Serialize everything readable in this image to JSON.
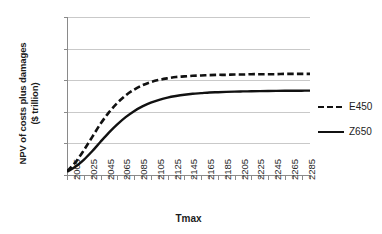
{
  "chart_data": {
    "type": "line",
    "title": "",
    "xlabel": "Tmax",
    "ylabel": "NPV of costs plus damages ($ trillion)",
    "ylabel_line1": "NPV of costs plus damages",
    "ylabel_line2": "($ trillion)",
    "xlim": [
      2005,
      2295
    ],
    "ylim": [
      0,
      5
    ],
    "y_ticks": [
      "0",
      "1",
      "2",
      "3",
      "4",
      "5"
    ],
    "y_tick_values": [
      0,
      1,
      2,
      3,
      4,
      5
    ],
    "x_tick_labels": [
      "2005",
      "2025",
      "2045",
      "2065",
      "2085",
      "2105",
      "2125",
      "2145",
      "2165",
      "2185",
      "2205",
      "2225",
      "2245",
      "2265",
      "2285"
    ],
    "x_minor_step": 10,
    "grid": "horizontal",
    "legend_position": "right",
    "x": [
      2005,
      2015,
      2025,
      2035,
      2045,
      2055,
      2065,
      2075,
      2085,
      2095,
      2105,
      2115,
      2125,
      2135,
      2145,
      2155,
      2165,
      2175,
      2185,
      2195,
      2205,
      2215,
      2225,
      2235,
      2245,
      2255,
      2265,
      2275,
      2285,
      2295
    ],
    "series": [
      {
        "name": "E450",
        "style": "dashed",
        "color": "#111111",
        "values": [
          0.12,
          0.4,
          0.78,
          1.2,
          1.62,
          1.98,
          2.28,
          2.52,
          2.7,
          2.84,
          2.94,
          3.01,
          3.06,
          3.1,
          3.12,
          3.14,
          3.15,
          3.16,
          3.17,
          3.17,
          3.18,
          3.18,
          3.19,
          3.19,
          3.19,
          3.19,
          3.2,
          3.2,
          3.2,
          3.2
        ]
      },
      {
        "name": "Z650",
        "style": "solid",
        "color": "#111111",
        "values": [
          0.1,
          0.26,
          0.48,
          0.75,
          1.05,
          1.34,
          1.6,
          1.83,
          2.02,
          2.17,
          2.29,
          2.38,
          2.45,
          2.5,
          2.54,
          2.57,
          2.59,
          2.61,
          2.62,
          2.63,
          2.64,
          2.645,
          2.65,
          2.655,
          2.66,
          2.662,
          2.665,
          2.667,
          2.668,
          2.67
        ]
      }
    ]
  },
  "legend": {
    "items": [
      {
        "label": "E450",
        "style": "dashed"
      },
      {
        "label": "Z650",
        "style": "solid"
      }
    ]
  }
}
